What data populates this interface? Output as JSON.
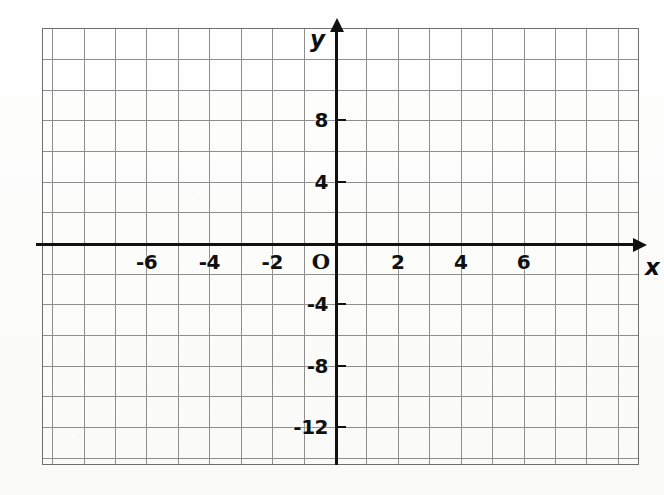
{
  "figure": {
    "kind": "coordinate-plane",
    "background_color": "#fdfdfc",
    "grid_color": "#6f6f6f",
    "axis_color": "#111111",
    "label_color": "#101010"
  },
  "axes": {
    "x": {
      "name": "x",
      "arrow": "arrow-right",
      "tick_labels": [
        "-6",
        "-4",
        "-2",
        "2",
        "4",
        "6"
      ],
      "tick_values": [
        -6,
        -4,
        -2,
        2,
        4,
        6
      ],
      "range": [
        -9,
        10
      ],
      "step": 1
    },
    "y": {
      "name": "y",
      "arrow": "arrow-up",
      "tick_labels": [
        "8",
        "4",
        "-4",
        "-8",
        "-12"
      ],
      "tick_values": [
        8,
        4,
        -4,
        -8,
        -12
      ],
      "range": [
        -14,
        14
      ],
      "step": 2
    },
    "origin_label": "O"
  },
  "chart_data": {
    "type": "scatter",
    "title": "",
    "subtitle": "",
    "xlabel": "x",
    "ylabel": "y",
    "xlim": [
      -9,
      10
    ],
    "ylim": [
      -14,
      14
    ],
    "xticks": [
      -6,
      -4,
      -2,
      2,
      4,
      6
    ],
    "xticklabels": [
      "-6",
      "-4",
      "-2",
      "2",
      "4",
      "6"
    ],
    "yticks": [
      8,
      4,
      -4,
      -8,
      -12
    ],
    "yticklabels": [
      "8",
      "4",
      "-4",
      "-8",
      "-12"
    ],
    "grid": true,
    "grid_step_x": 1,
    "grid_step_y": 2,
    "legend": null,
    "series": [],
    "annotations": [
      "O"
    ]
  }
}
